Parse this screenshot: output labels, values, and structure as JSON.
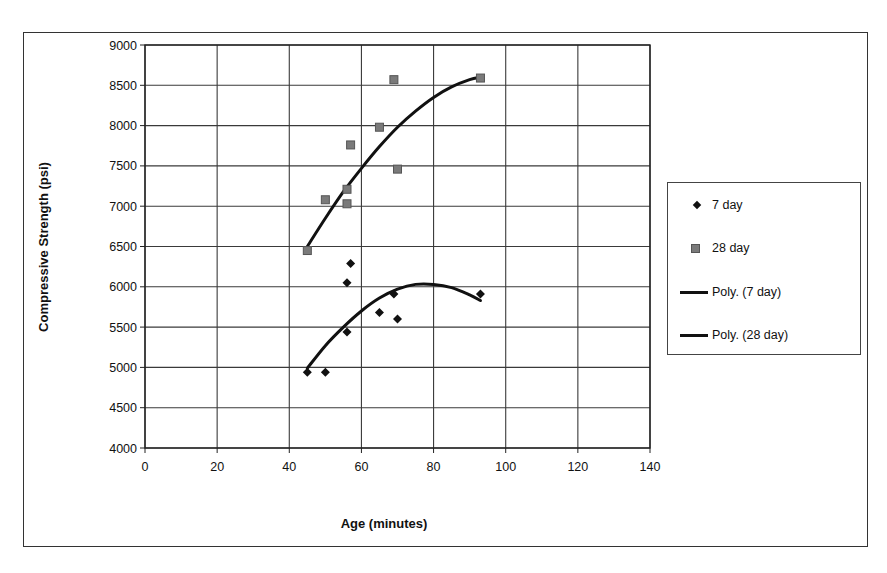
{
  "chart_data": {
    "type": "scatter",
    "title": "",
    "xlabel": "Age (minutes)",
    "ylabel": "Compressive Strength (psi)",
    "xlim": [
      0,
      140
    ],
    "ylim": [
      4000,
      9000
    ],
    "x_ticks": [
      0,
      20,
      40,
      60,
      80,
      100,
      120,
      140
    ],
    "y_ticks": [
      4000,
      4500,
      5000,
      5500,
      6000,
      6500,
      7000,
      7500,
      8000,
      8500,
      9000
    ],
    "grid": true,
    "legend_position": "right",
    "series": [
      {
        "name": "7 day",
        "marker": "diamond",
        "color": "#111111",
        "points": [
          [
            45,
            4940
          ],
          [
            50,
            4940
          ],
          [
            56,
            5440
          ],
          [
            56,
            6050
          ],
          [
            57,
            6290
          ],
          [
            65,
            5680
          ],
          [
            69,
            5910
          ],
          [
            70,
            5600
          ],
          [
            93,
            5910
          ]
        ]
      },
      {
        "name": "28 day",
        "marker": "square",
        "color": "#7a7a7a",
        "points": [
          [
            45,
            6450
          ],
          [
            50,
            7080
          ],
          [
            56,
            7210
          ],
          [
            56,
            7030
          ],
          [
            57,
            7760
          ],
          [
            65,
            7980
          ],
          [
            69,
            8570
          ],
          [
            70,
            7460
          ],
          [
            93,
            8590
          ]
        ]
      },
      {
        "name": "Poly. (7 day)",
        "type": "trendline-polynomial",
        "color": "#111111",
        "points": [
          [
            45,
            4990
          ],
          [
            50,
            5270
          ],
          [
            55,
            5500
          ],
          [
            60,
            5700
          ],
          [
            65,
            5860
          ],
          [
            70,
            5970
          ],
          [
            75,
            6030
          ],
          [
            80,
            6030
          ],
          [
            85,
            5990
          ],
          [
            90,
            5900
          ],
          [
            93,
            5830
          ]
        ]
      },
      {
        "name": "Poly. (28 day)",
        "type": "trendline-polynomial",
        "color": "#111111",
        "points": [
          [
            45,
            6500
          ],
          [
            50,
            6850
          ],
          [
            55,
            7180
          ],
          [
            60,
            7470
          ],
          [
            65,
            7740
          ],
          [
            70,
            7980
          ],
          [
            75,
            8180
          ],
          [
            80,
            8350
          ],
          [
            85,
            8480
          ],
          [
            90,
            8570
          ],
          [
            93,
            8600
          ]
        ]
      }
    ]
  },
  "axes": {
    "xlabel": "Age (minutes)",
    "ylabel": "Compressive Strength (psi)"
  },
  "legend": {
    "items": [
      {
        "label": "7 day",
        "symbol": "diamond"
      },
      {
        "label": "28 day",
        "symbol": "square"
      },
      {
        "label": "Poly. (7 day)",
        "symbol": "line"
      },
      {
        "label": "Poly. (28 day)",
        "symbol": "line"
      }
    ]
  }
}
